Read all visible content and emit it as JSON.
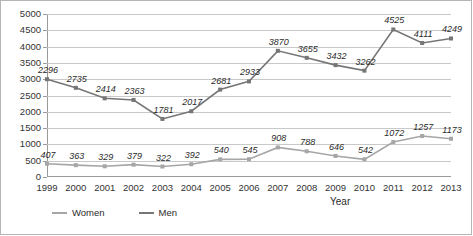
{
  "chart_data": {
    "type": "line",
    "title": "",
    "xlabel": "Year",
    "ylabel": "",
    "ylim": [
      0,
      5000
    ],
    "ytick_step": 500,
    "yticks": [
      0,
      500,
      1000,
      1500,
      2000,
      2500,
      3000,
      3500,
      4000,
      4500,
      5000
    ],
    "grid": true,
    "legend_position": "bottom-left",
    "categories": [
      "1999",
      "2000",
      "2001",
      "2002",
      "2003",
      "2004",
      "2005",
      "2006",
      "2007",
      "2008",
      "2009",
      "2010",
      "2011",
      "2012",
      "2013"
    ],
    "series": [
      {
        "name": "Women",
        "color": "#a6a6a6",
        "marker": "square",
        "values": [
          407,
          363,
          329,
          379,
          322,
          392,
          540,
          545,
          908,
          788,
          646,
          542,
          1072,
          1257,
          1173
        ],
        "labels": [
          "407",
          "363",
          "329",
          "379",
          "322",
          "392",
          "540",
          "545",
          "908",
          "788",
          "646",
          "542",
          "1072",
          "1257",
          "1173"
        ]
      },
      {
        "name": "Men",
        "color": "#767676",
        "marker": "square",
        "values": [
          3000,
          2735,
          2414,
          2363,
          1781,
          2017,
          2681,
          2933,
          3870,
          3655,
          3432,
          3262,
          4525,
          4111,
          4249
        ],
        "labels": [
          "2296",
          "2735",
          "2414",
          "2363",
          "1781",
          "2017",
          "2681",
          "2933",
          "3870",
          "3655",
          "3432",
          "3262",
          "4525",
          "4111",
          "4249"
        ]
      }
    ]
  },
  "legend": {
    "items": [
      {
        "label": "Women",
        "color": "#a6a6a6"
      },
      {
        "label": "Men",
        "color": "#767676"
      }
    ]
  },
  "axes": {
    "x_title": "Year"
  },
  "colors": {
    "grid": "#c9c9c9",
    "axis": "#9a9a9a",
    "text": "#2b2b2b",
    "women": "#a6a6a6",
    "men": "#767676"
  }
}
